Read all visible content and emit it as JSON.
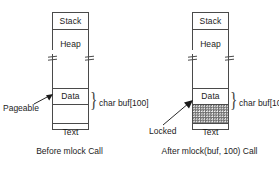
{
  "figure": {
    "type": "memory-layout-diagram",
    "background_color": "#ffffff",
    "line_color": "#4a4a4a",
    "text_color": "#1c1c1c",
    "locked_fill_color": "#6f6f6f"
  },
  "panels": [
    {
      "id": "before",
      "caption": "Before mlock Call",
      "segments": [
        {
          "name": "stack",
          "label": "Stack"
        },
        {
          "name": "heap",
          "label": "Heap"
        },
        {
          "name": "data",
          "label": "Data"
        },
        {
          "name": "buffer",
          "label": "",
          "state": "pageable",
          "hatched": false
        },
        {
          "name": "text",
          "label": "Text"
        }
      ],
      "buffer_annotation": "char buf[100]",
      "callout": "Pageable"
    },
    {
      "id": "after",
      "caption": "After mlock(buf, 100) Call",
      "segments": [
        {
          "name": "stack",
          "label": "Stack"
        },
        {
          "name": "heap",
          "label": "Heap"
        },
        {
          "name": "data",
          "label": "Data"
        },
        {
          "name": "buffer",
          "label": "",
          "state": "locked",
          "hatched": true
        },
        {
          "name": "text",
          "label": "Text"
        }
      ],
      "buffer_annotation": "char buf[100]",
      "callout": "Locked"
    }
  ]
}
